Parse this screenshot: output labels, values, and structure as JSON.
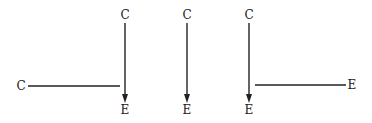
{
  "diagram": {
    "colors": {
      "stroke": "#222222",
      "background": "#ffffff"
    },
    "panels": [
      {
        "id": "left",
        "nodes": [
          {
            "id": "c_top",
            "label": "C",
            "x": 125,
            "y": 19
          },
          {
            "id": "c_left",
            "label": "C",
            "x": 21,
            "y": 90
          },
          {
            "id": "e_bottom",
            "label": "E",
            "x": 125,
            "y": 113
          }
        ],
        "edges": [
          {
            "from": "c_top",
            "to": "e_bottom",
            "type": "arrow"
          },
          {
            "from": "c_left",
            "to": "vertical-arrow",
            "type": "line"
          }
        ]
      },
      {
        "id": "middle",
        "nodes": [
          {
            "id": "c_top",
            "label": "C",
            "x": 187,
            "y": 19
          },
          {
            "id": "e_bottom",
            "label": "E",
            "x": 187,
            "y": 113
          }
        ],
        "edges": [
          {
            "from": "c_top",
            "to": "e_bottom",
            "type": "arrow"
          }
        ]
      },
      {
        "id": "right",
        "nodes": [
          {
            "id": "c_top",
            "label": "C",
            "x": 249,
            "y": 19
          },
          {
            "id": "e_bottom",
            "label": "E",
            "x": 249,
            "y": 113
          },
          {
            "id": "e_right",
            "label": "E",
            "x": 352,
            "y": 89
          }
        ],
        "edges": [
          {
            "from": "c_top",
            "to": "e_bottom",
            "type": "arrow"
          },
          {
            "from": "vertical-arrow",
            "to": "e_right",
            "type": "line"
          }
        ]
      }
    ]
  }
}
